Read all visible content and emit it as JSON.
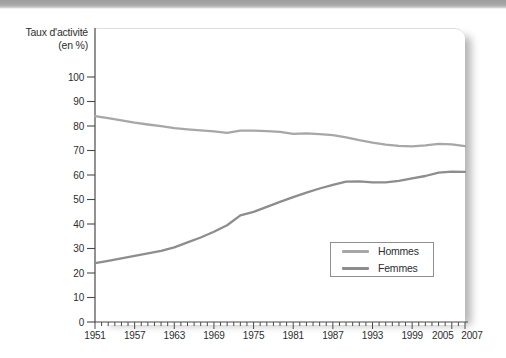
{
  "figure": {
    "y_axis_title_line1": "Taux d'activité",
    "y_axis_title_line2": "(en %)"
  },
  "chart_data": {
    "type": "line",
    "title": "",
    "ylabel": "Taux d'activité (en %)",
    "xlabel": "",
    "grid": false,
    "legend_position": "inside lower right",
    "xlim": [
      1951,
      2007
    ],
    "ylim": [
      0,
      100
    ],
    "y_ticks": [
      0,
      10,
      20,
      30,
      40,
      50,
      60,
      70,
      80,
      90,
      100
    ],
    "x_tick_years": [
      1951,
      1957,
      1963,
      1969,
      1975,
      1981,
      1987,
      1993,
      1999,
      2005,
      2007
    ],
    "x_tick_labels": [
      "1951",
      "1957",
      "1963",
      "1969",
      "1975",
      "1981",
      "1987",
      "1993",
      "1999",
      "2005",
      "2007"
    ],
    "minor_x_tick_step_years": 1,
    "x": [
      1951,
      1953,
      1955,
      1957,
      1959,
      1961,
      1963,
      1965,
      1967,
      1969,
      1971,
      1973,
      1975,
      1977,
      1979,
      1981,
      1983,
      1985,
      1987,
      1989,
      1991,
      1993,
      1995,
      1997,
      1999,
      2001,
      2003,
      2005,
      2007
    ],
    "series": [
      {
        "name": "Hommes",
        "color": "#a7a7a7",
        "values": [
          84,
          83.2,
          82.3,
          81.4,
          80.6,
          79.9,
          79.1,
          78.6,
          78.2,
          77.8,
          77.2,
          78.1,
          78.1,
          77.9,
          77.6,
          76.8,
          77.0,
          76.7,
          76.3,
          75.4,
          74.2,
          73.2,
          72.4,
          71.9,
          71.7,
          72.1,
          72.7,
          72.5,
          71.8
        ]
      },
      {
        "name": "Femmes",
        "color": "#8d8d8d",
        "values": [
          24,
          25,
          26,
          27,
          28,
          29,
          30.5,
          32.5,
          34.5,
          36.8,
          39.5,
          43.5,
          45,
          47,
          49,
          51,
          52.8,
          54.5,
          56,
          57.3,
          57.4,
          57,
          57,
          57.6,
          58.6,
          59.6,
          61,
          61.4,
          61.3
        ]
      }
    ]
  }
}
